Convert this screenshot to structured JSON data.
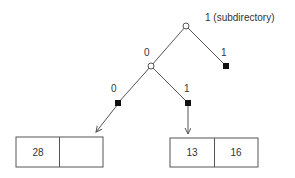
{
  "diagram": {
    "root_label": "1 (subdirectory)",
    "edges": {
      "root_left": "0",
      "root_right": "1",
      "mid_left": "0",
      "mid_right": "1"
    },
    "buckets": [
      {
        "cells": [
          "28",
          ""
        ]
      },
      {
        "cells": [
          "13",
          "16"
        ]
      }
    ],
    "colors": {
      "stroke": "#555555",
      "node_fill_internal": "#ffffff",
      "node_fill_leaf": "#111111",
      "text": "#333333"
    }
  }
}
